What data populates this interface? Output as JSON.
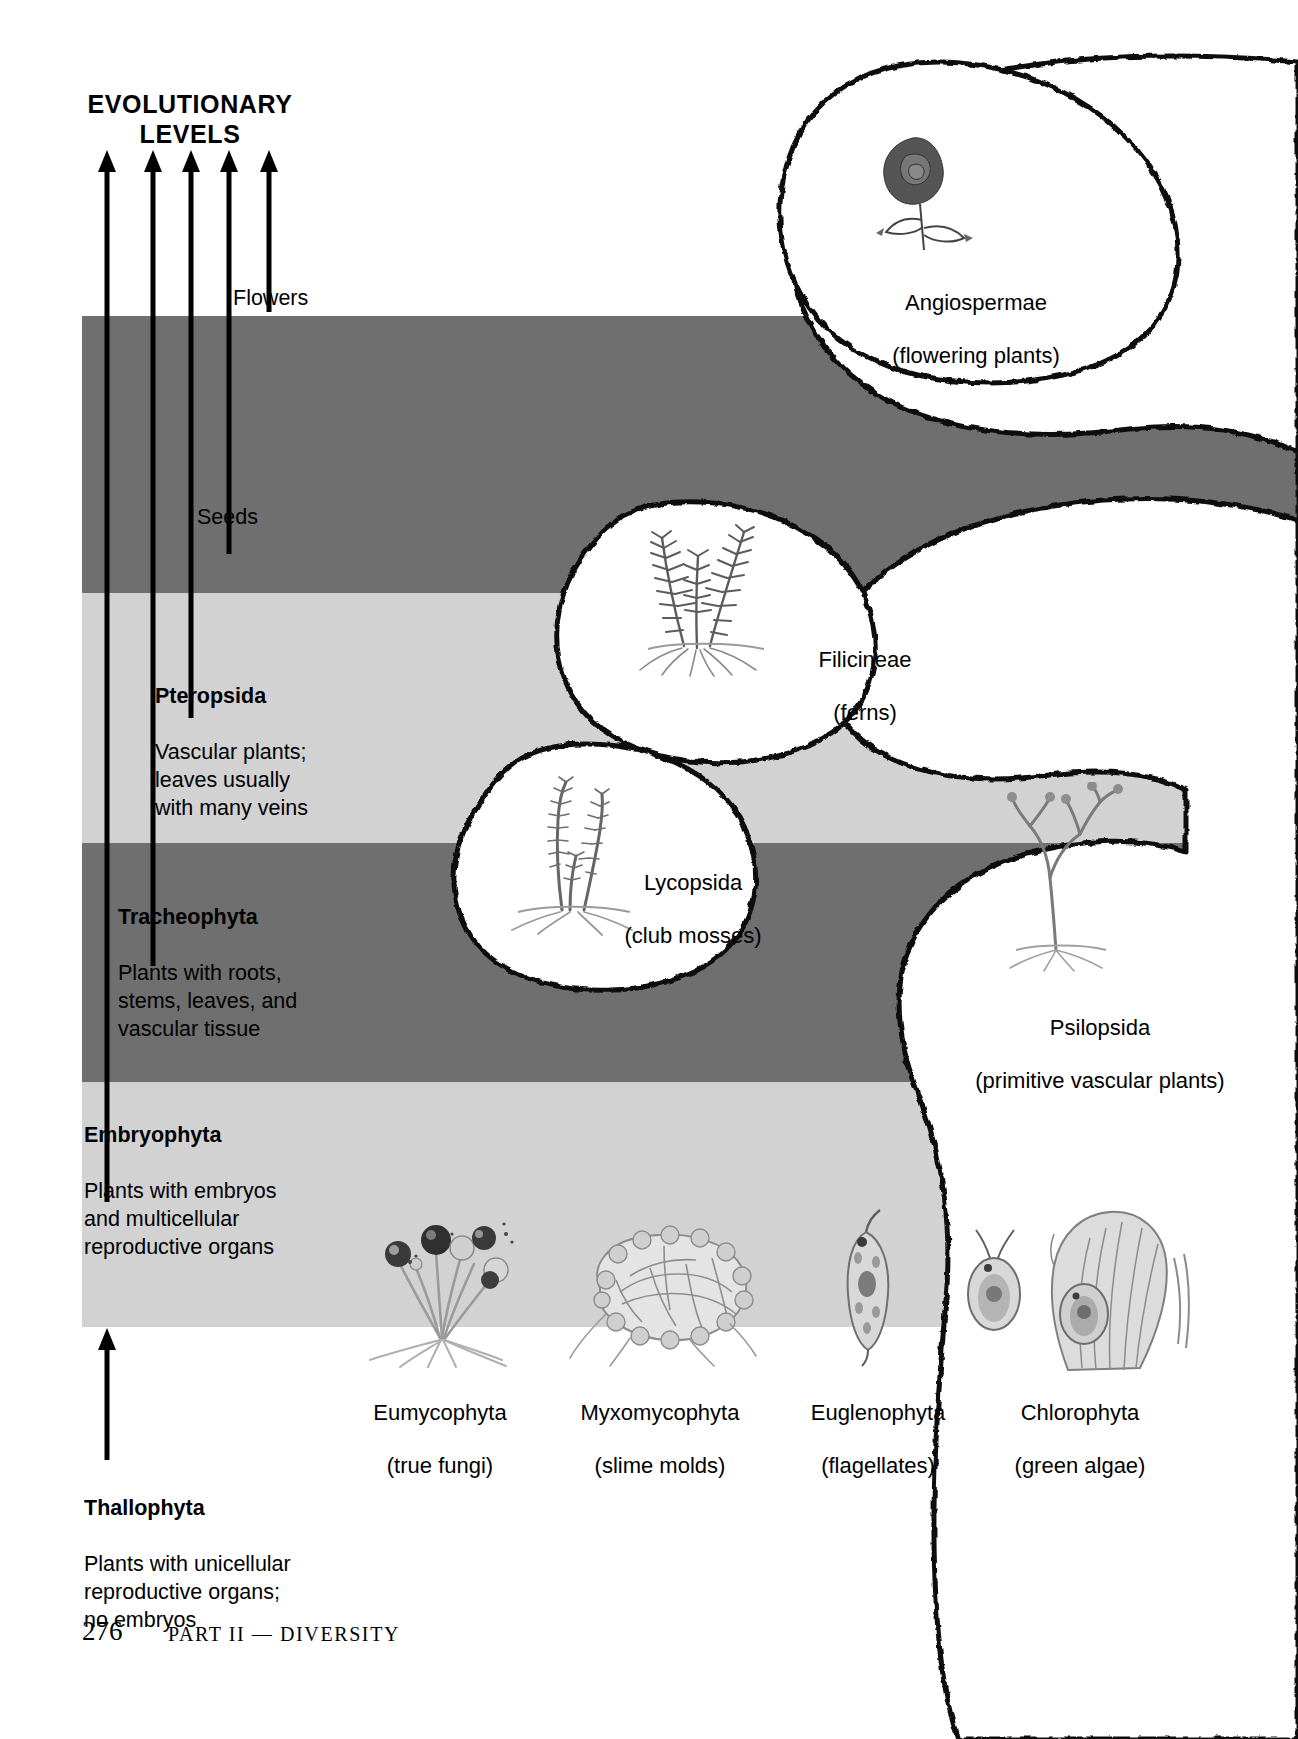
{
  "page": {
    "title": "EVOLUTIONARY\nLEVELS",
    "folio": "276",
    "running_head": "PART II — DIVERSITY"
  },
  "colors": {
    "band_dark": "#6f6f6f",
    "band_light": "#d2d2d2",
    "ink": "#000000",
    "paper": "#ffffff"
  },
  "trait_tags": [
    {
      "label": "Flowers"
    },
    {
      "label": "Seeds"
    }
  ],
  "levels": [
    {
      "name": "Pteropsida",
      "description": "Vascular plants;\nleaves usually\nwith many veins"
    },
    {
      "name": "Tracheophyta",
      "description": "Plants with roots,\nstems, leaves, and\nvascular tissue"
    },
    {
      "name": "Embryophyta",
      "description": "Plants with embryos\nand multicellular\nreproductive organs"
    },
    {
      "name": "Thallophyta",
      "description": "Plants with unicellular\nreproductive organs;\nno embryos"
    }
  ],
  "organisms": [
    {
      "id": "angiospermae",
      "name": "Angiospermae",
      "common": "(flowering plants)",
      "icon": "rose-illustration"
    },
    {
      "id": "filicineae",
      "name": "Filicineae",
      "common": "(ferns)",
      "icon": "fern-illustration"
    },
    {
      "id": "lycopsida",
      "name": "Lycopsida",
      "common": "(club mosses)",
      "icon": "club-moss-illustration"
    },
    {
      "id": "psilopsida",
      "name": "Psilopsida",
      "common": "(primitive vascular plants)",
      "icon": "psilopsid-illustration"
    },
    {
      "id": "eumycophyta",
      "name": "Eumycophyta",
      "common": "(true fungi)",
      "icon": "fungi-illustration"
    },
    {
      "id": "myxomycophyta",
      "name": "Myxomycophyta",
      "common": "(slime molds)",
      "icon": "slime-mold-illustration"
    },
    {
      "id": "euglenophyta",
      "name": "Euglenophyta",
      "common": "(flagellates)",
      "icon": "euglena-illustration"
    },
    {
      "id": "chlorophyta",
      "name": "Chlorophyta",
      "common": "(green algae)",
      "icon": "green-algae-illustration"
    }
  ]
}
